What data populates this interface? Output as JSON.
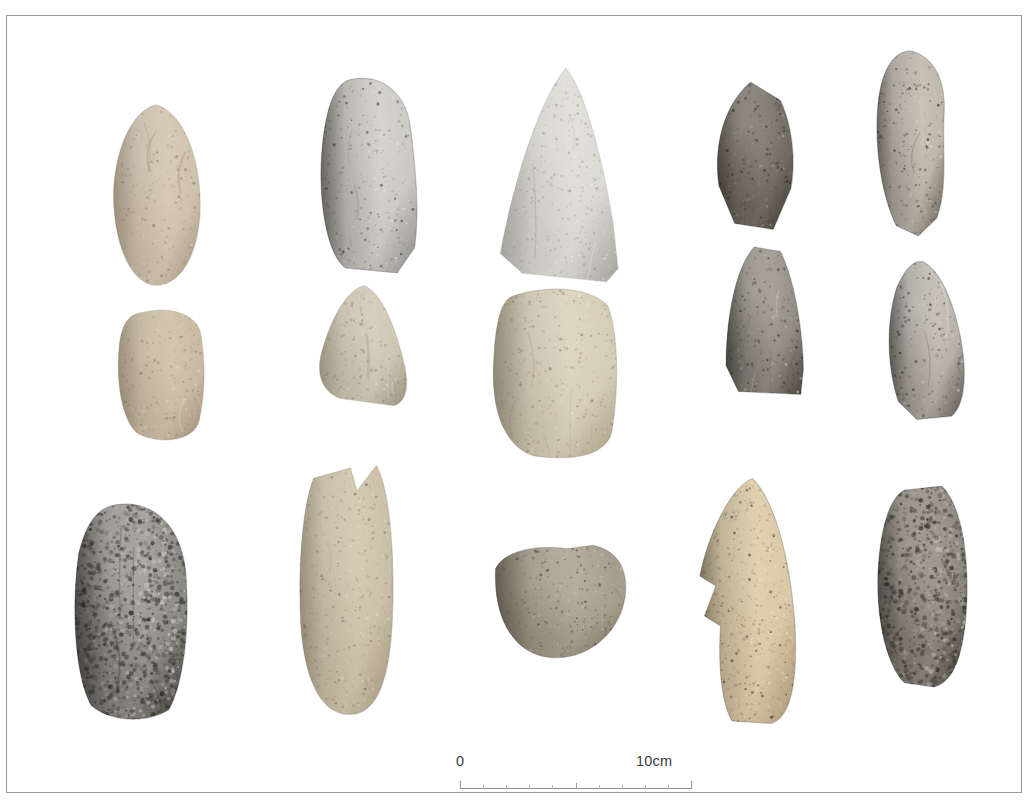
{
  "figure": {
    "kind": "archaeological-artifact-plate",
    "background_color": "#ffffff",
    "border_color": "#9a9a9a",
    "rows": 3,
    "columns": 5,
    "artifact_count": 15
  },
  "scale": {
    "zero_label": "0",
    "max_label": "10cm",
    "units": "cm",
    "length_cm": 10,
    "minor_ticks": 10,
    "line_color": "#8e8e8e",
    "text_color": "#3b3b3b"
  },
  "artifacts": [
    {
      "id": "a1",
      "row": 1,
      "col": 1,
      "name": "oval-adze-tan",
      "desc": "complete oval adze, tan-beige weathered limestone",
      "left": 100,
      "top": 86,
      "width": 98,
      "height": 186,
      "base": "#cfc2ac",
      "light": "#e6dccb",
      "dark": "#9d8e79",
      "shadow": "#7d7060",
      "shape": "oval-point"
    },
    {
      "id": "a2",
      "row": 1,
      "col": 2,
      "name": "adze-grey-white-butt",
      "desc": "grey-white stone adze butt fragment with dark spall",
      "left": 306,
      "top": 58,
      "width": 108,
      "height": 200,
      "base": "#cbc9c2",
      "light": "#e9e7e1",
      "dark": "#8d8b85",
      "shadow": "#2a2723",
      "shape": "block-round-top"
    },
    {
      "id": "a3",
      "row": 1,
      "col": 3,
      "name": "large-pointed-adze-pale",
      "desc": "large pale grey triangular pointed adze blade",
      "left": 487,
      "top": 50,
      "width": 128,
      "height": 218,
      "base": "#d9d8d2",
      "light": "#f0efe9",
      "dark": "#a6a49c",
      "shadow": "#8b8980",
      "shape": "triangle-point"
    },
    {
      "id": "a4",
      "row": 1,
      "col": 4,
      "name": "dark-speckled-flake",
      "desc": "dark grey speckled flake with pale lower margin",
      "left": 703,
      "top": 63,
      "width": 88,
      "height": 152,
      "base": "#6f6a61",
      "light": "#b7b2a7",
      "dark": "#3b372f",
      "shadow": "#24211b",
      "shape": "angular-flake"
    },
    {
      "id": "a5",
      "row": 1,
      "col": 5,
      "name": "elongated-flake-dark-edge",
      "desc": "elongated flake, dark shadow on left face",
      "left": 858,
      "top": 33,
      "width": 92,
      "height": 188,
      "base": "#b9b3a8",
      "light": "#e3ddd2",
      "dark": "#5d574d",
      "shadow": "#110f0c",
      "shape": "elongated-flake"
    },
    {
      "id": "b1",
      "row": 2,
      "col": 1,
      "name": "rounded-block-tan",
      "desc": "rounded rectangular tan fragment, butt end",
      "left": 105,
      "top": 291,
      "width": 96,
      "height": 137,
      "base": "#c9bba3",
      "light": "#e4d9c3",
      "dark": "#9c8e76",
      "shadow": "#7a6e5b",
      "shape": "rounded-block"
    },
    {
      "id": "b2",
      "row": 2,
      "col": 2,
      "name": "granular-triangle-pale",
      "desc": "pale granular triangular adze fragment",
      "left": 305,
      "top": 267,
      "width": 100,
      "height": 124,
      "base": "#cdc4b1",
      "light": "#e8e1d0",
      "dark": "#9a917f",
      "shadow": "#7c7464",
      "shape": "triangle-round"
    },
    {
      "id": "b3",
      "row": 2,
      "col": 3,
      "name": "cream-block-translucent",
      "desc": "large cream block with translucent chert patches",
      "left": 481,
      "top": 268,
      "width": 133,
      "height": 177,
      "base": "#d6cdb8",
      "light": "#efe8d5",
      "dark": "#a79c83",
      "shadow": "#6d6453",
      "shape": "big-block"
    },
    {
      "id": "b4",
      "row": 2,
      "col": 4,
      "name": "grey-trapezoid-dark-streak",
      "desc": "grey trapezoidal flake with dark vertical streak",
      "left": 712,
      "top": 228,
      "width": 88,
      "height": 152,
      "base": "#8f8b83",
      "light": "#cfcbc2",
      "dark": "#4a463e",
      "shadow": "#1b1813",
      "shape": "trapezoid"
    },
    {
      "id": "b5",
      "row": 2,
      "col": 5,
      "name": "flaked-grey-white-core",
      "desc": "grey-white flaked core fragment",
      "left": 873,
      "top": 243,
      "width": 92,
      "height": 162,
      "base": "#b3aea4",
      "light": "#ece9e2",
      "dark": "#57524a",
      "shadow": "#14120f",
      "shape": "flaked-core"
    },
    {
      "id": "c1",
      "row": 3,
      "col": 1,
      "name": "granite-speckled-adze",
      "desc": "dark grey coarse speckled granite adze",
      "left": 62,
      "top": 484,
      "width": 122,
      "height": 223,
      "base": "#8e8b86",
      "light": "#d5d2cc",
      "dark": "#33312d",
      "shadow": "#1f1d1a",
      "shape": "oval-block",
      "texture": "speckle-coarse"
    },
    {
      "id": "c2",
      "row": 3,
      "col": 2,
      "name": "granular-column-tan",
      "desc": "tan granular columnar adze with notched butt",
      "left": 283,
      "top": 447,
      "width": 108,
      "height": 254,
      "base": "#cbc0a7",
      "light": "#e8e0cb",
      "dark": "#9a8e76",
      "shadow": "#6e6454",
      "shape": "column-notch",
      "texture": "speckle-fine"
    },
    {
      "id": "c3",
      "row": 3,
      "col": 3,
      "name": "bowl-fragment-grey",
      "desc": "rounded bowl-like grey-brown fragment",
      "left": 480,
      "top": 527,
      "width": 143,
      "height": 116,
      "base": "#a79d8c",
      "light": "#d4cbb9",
      "dark": "#6e6555",
      "shadow": "#332d24",
      "shape": "bowl",
      "texture": "speckle-fine"
    },
    {
      "id": "c4",
      "row": 3,
      "col": 4,
      "name": "sandstone-teardrop-notch",
      "desc": "sandy porous teardrop adze with deep side notch",
      "left": 679,
      "top": 460,
      "width": 115,
      "height": 250,
      "base": "#d8c8a6",
      "light": "#efe2c4",
      "dark": "#a89372",
      "shadow": "#2b2318",
      "shape": "teardrop-notch",
      "texture": "speckle-porous"
    },
    {
      "id": "c5",
      "row": 3,
      "col": 5,
      "name": "rough-dark-core",
      "desc": "rough dark grey core/adze roughout",
      "left": 862,
      "top": 468,
      "width": 104,
      "height": 205,
      "base": "#8b867c",
      "light": "#c9c4ba",
      "dark": "#3a362f",
      "shadow": "#181612",
      "shape": "rough-core",
      "texture": "speckle-coarse"
    }
  ]
}
